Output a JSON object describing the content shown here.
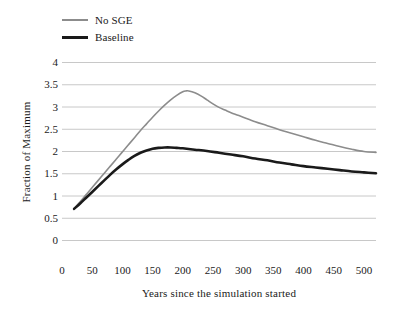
{
  "chart_data": {
    "type": "line",
    "title": "",
    "xlabel": "Years since the simulation started",
    "ylabel": "Fraction of Maximum",
    "xlim": [
      0,
      520
    ],
    "ylim": [
      0,
      4
    ],
    "xticks": [
      0,
      50,
      100,
      150,
      200,
      250,
      300,
      350,
      400,
      450,
      500
    ],
    "yticks": [
      0,
      0.5,
      1,
      1.5,
      2,
      2.5,
      3,
      3.5,
      4
    ],
    "ytick_labels": [
      "0",
      "0.5",
      "1",
      "1.5",
      "2",
      "2.5",
      "3",
      "3.5",
      "4"
    ],
    "xtick_labels": [
      "0",
      "50",
      "100",
      "150",
      "200",
      "250",
      "300",
      "350",
      "400",
      "450",
      "500"
    ],
    "grid": "horizontal",
    "legend_position": "top-left",
    "series": [
      {
        "name": "No SGE",
        "color": "#8c8c8c",
        "width": 1.6,
        "x": [
          20,
          30,
          40,
          50,
          60,
          70,
          80,
          90,
          100,
          110,
          120,
          130,
          140,
          150,
          160,
          170,
          180,
          190,
          200,
          205,
          210,
          220,
          230,
          240,
          250,
          260,
          270,
          280,
          290,
          300,
          320,
          340,
          360,
          380,
          400,
          420,
          440,
          460,
          480,
          500,
          520
        ],
        "y": [
          0.7,
          0.86,
          1.02,
          1.18,
          1.34,
          1.5,
          1.66,
          1.82,
          1.98,
          2.14,
          2.3,
          2.46,
          2.61,
          2.76,
          2.9,
          3.03,
          3.15,
          3.25,
          3.33,
          3.35,
          3.35,
          3.31,
          3.24,
          3.15,
          3.06,
          2.98,
          2.92,
          2.86,
          2.81,
          2.76,
          2.66,
          2.57,
          2.48,
          2.4,
          2.32,
          2.24,
          2.17,
          2.1,
          2.04,
          1.99,
          1.97
        ]
      },
      {
        "name": "Baseline",
        "color": "#1a1a1a",
        "width": 2.6,
        "x": [
          20,
          30,
          40,
          50,
          60,
          70,
          80,
          90,
          100,
          110,
          120,
          130,
          140,
          150,
          160,
          170,
          180,
          190,
          200,
          220,
          240,
          260,
          280,
          300,
          320,
          340,
          360,
          380,
          400,
          420,
          440,
          460,
          480,
          500,
          520
        ],
        "y": [
          0.7,
          0.82,
          0.95,
          1.08,
          1.21,
          1.34,
          1.47,
          1.59,
          1.7,
          1.8,
          1.89,
          1.96,
          2.01,
          2.05,
          2.07,
          2.08,
          2.08,
          2.07,
          2.06,
          2.03,
          2.0,
          1.96,
          1.92,
          1.88,
          1.83,
          1.79,
          1.74,
          1.7,
          1.66,
          1.63,
          1.6,
          1.57,
          1.54,
          1.52,
          1.5
        ]
      }
    ],
    "colors": {
      "grid": "#c8c8c8",
      "text": "#1a1a1a",
      "no_sge": "#8c8c8c",
      "baseline": "#1a1a1a",
      "background": "#ffffff"
    }
  },
  "legend": {
    "items": [
      {
        "label": "No SGE"
      },
      {
        "label": "Baseline"
      }
    ]
  },
  "axes": {
    "y_title": "Fraction of Maximum",
    "x_title": "Years since the simulation started"
  }
}
